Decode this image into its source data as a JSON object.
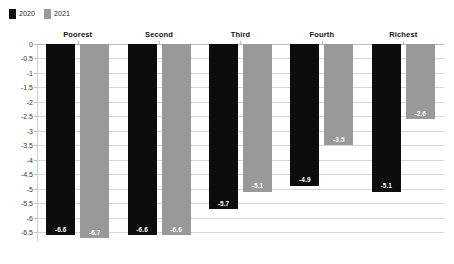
{
  "legend": {
    "entries": [
      {
        "label": "2020",
        "color": "#0d0d0d"
      },
      {
        "label": "2021",
        "color": "#999999"
      }
    ]
  },
  "axis": {
    "ticks": [
      "0",
      "-0.5",
      "-1",
      "-1.5",
      "-2",
      "-2.5",
      "-3",
      "-3.5",
      "-4",
      "-4.5",
      "-5",
      "-5.5",
      "-6",
      "-6.5"
    ]
  },
  "labels": {
    "group_0": "Poorest",
    "group_1": "Second",
    "group_2": "Third",
    "group_3": "Fourth",
    "group_4": "Richest",
    "v_0_0": "-6.6",
    "v_0_1": "-6.7",
    "v_1_0": "-6.6",
    "v_1_1": "-6.6",
    "v_2_0": "-5.7",
    "v_2_1": "-5.1",
    "v_3_0": "-4.9",
    "v_3_1": "-3.5",
    "v_4_0": "-5.1",
    "v_4_1": "-2.6"
  },
  "chart_data": {
    "type": "bar",
    "title": "",
    "subtitle": "",
    "xlabel": "",
    "ylabel": "",
    "categories": [
      "Poorest",
      "Second",
      "Third",
      "Fourth",
      "Richest"
    ],
    "series": [
      {
        "name": "2020",
        "color": "#0d0d0d",
        "values": [
          -6.6,
          -6.6,
          -5.7,
          -4.9,
          -5.1
        ]
      },
      {
        "name": "2021",
        "color": "#999999",
        "values": [
          -6.7,
          -6.6,
          -5.1,
          -3.5,
          -2.6
        ]
      }
    ],
    "ylim": [
      -6.8,
      0
    ],
    "ytick_values": [
      0,
      -0.5,
      -1,
      -1.5,
      -2,
      -2.5,
      -3,
      -3.5,
      -4,
      -4.5,
      -5,
      -5.5,
      -6,
      -6.5
    ],
    "grid": true,
    "grid_axis": "y",
    "legend_position": "top-left",
    "data_labels": true,
    "orientation": "vertical",
    "bars_direction": "downward"
  }
}
